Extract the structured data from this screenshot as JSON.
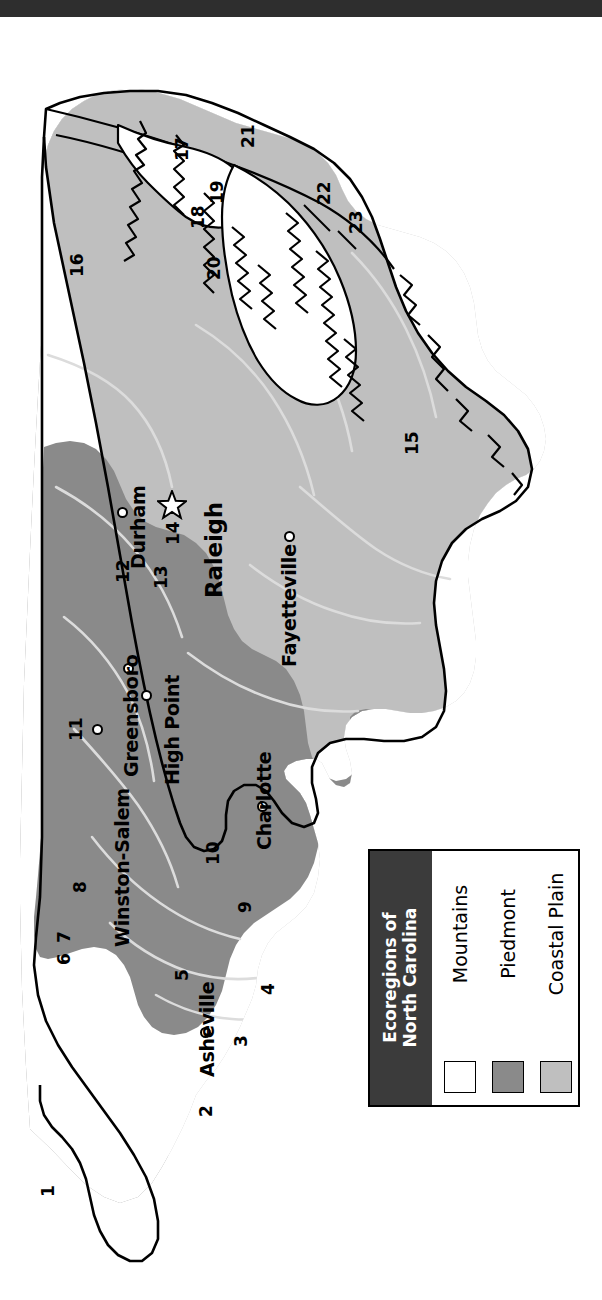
{
  "title_bar": {
    "present": true,
    "color": "#2e2e2e"
  },
  "map": {
    "name": "Ecoregions of North Carolina",
    "background": "#ffffff",
    "region_colors": {
      "mountains": "#ffffff",
      "piedmont": "#8a8a8a",
      "coastal_plain": "#bfbfbf",
      "outline": "#000000",
      "rivers": "#d8d8d8"
    },
    "cities": [
      {
        "name": "Asheville",
        "marker": "circle",
        "x": 205,
        "y": 1015,
        "label_x": 196,
        "label_y": 1050,
        "rot": -90
      },
      {
        "name": "Charlotte",
        "marker": "circle",
        "x": 262,
        "y": 789,
        "label_x": 253,
        "label_y": 824,
        "rot": -90
      },
      {
        "name": "Winston-Salem",
        "marker": "circle",
        "x": 97,
        "y": 712,
        "label_x": 112,
        "label_y": 906,
        "rot": -90
      },
      {
        "name": "Greensboro",
        "marker": "circle",
        "x": 128,
        "y": 651,
        "label_x": 119,
        "label_y": 746,
        "rot": -90
      },
      {
        "name": "High Point",
        "marker": "circle",
        "x": 146,
        "y": 678,
        "label_x": 163,
        "label_y": 758,
        "rot": -90
      },
      {
        "name": "Durham",
        "marker": "circle",
        "x": 137,
        "y": 529,
        "label_x": 128,
        "label_y": 546,
        "rot": -90
      },
      {
        "name": "Fayetteville",
        "marker": "circle",
        "x": 289,
        "y": 533,
        "label_x": 279,
        "label_y": 637,
        "rot": -90
      },
      {
        "name": "Raleigh",
        "marker": "star",
        "x": 176,
        "y": 494,
        "label_x": 201,
        "label_y": 572,
        "rot": -90
      }
    ],
    "ecoregion_numbers": [
      {
        "n": "1",
        "x": 38,
        "y": 1165
      },
      {
        "n": "2",
        "x": 196,
        "y": 1086
      },
      {
        "n": "3",
        "x": 231,
        "y": 1015
      },
      {
        "n": "4",
        "x": 258,
        "y": 964
      },
      {
        "n": "5",
        "x": 172,
        "y": 950
      },
      {
        "n": "6",
        "x": 56,
        "y": 933
      },
      {
        "n": "7",
        "x": 56,
        "y": 910
      },
      {
        "n": "8",
        "x": 72,
        "y": 860
      },
      {
        "n": "9",
        "x": 235,
        "y": 882
      },
      {
        "n": "10",
        "x": 205,
        "y": 826
      },
      {
        "n": "11",
        "x": 68,
        "y": 703
      },
      {
        "n": "12",
        "x": 115,
        "y": 545
      },
      {
        "n": "13",
        "x": 153,
        "y": 551
      },
      {
        "n": "14",
        "x": 165,
        "y": 507
      },
      {
        "n": "15",
        "x": 404,
        "y": 417
      },
      {
        "n": "16",
        "x": 69,
        "y": 239
      },
      {
        "n": "17",
        "x": 174,
        "y": 123
      },
      {
        "n": "18",
        "x": 190,
        "y": 191
      },
      {
        "n": "19",
        "x": 209,
        "y": 166
      },
      {
        "n": "20",
        "x": 206,
        "y": 242
      },
      {
        "n": "21",
        "x": 240,
        "y": 110
      },
      {
        "n": "22",
        "x": 316,
        "y": 167
      },
      {
        "n": "23",
        "x": 348,
        "y": 196
      }
    ]
  },
  "legend": {
    "title": "Ecoregions of\nNorth Carolina",
    "title_line1": "Ecoregions of",
    "title_line2": "North Carolina",
    "title_band_color": "#3b3b3b",
    "title_text_color": "#ffffff",
    "entries": [
      {
        "label": "Mountains",
        "swatch": "#ffffff"
      },
      {
        "label": "Piedmont",
        "swatch": "#8a8a8a"
      },
      {
        "label": "Coastal Plain",
        "swatch": "#bfbfbf"
      }
    ]
  }
}
